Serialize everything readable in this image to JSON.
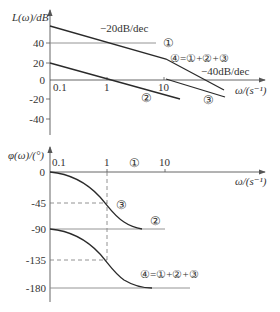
{
  "magnitude_plot": {
    "y_label": "L(ω)/dB",
    "x_label": "ω/(s⁻¹)",
    "y_ticks": [
      {
        "label": "40",
        "value": 40
      },
      {
        "label": "20",
        "value": 20
      },
      {
        "label": "0",
        "value": 0
      },
      {
        "label": "-20",
        "value": -20
      },
      {
        "label": "-40",
        "value": -40
      }
    ],
    "x_ticks": [
      {
        "label": "0.1",
        "value": 0.1
      },
      {
        "label": "1",
        "value": 1
      },
      {
        "label": "10",
        "value": 10
      }
    ],
    "slope_labels": {
      "minus20": "−20dB/dec",
      "minus40": "−40dB/dec"
    },
    "curve_labels": {
      "c1": "①",
      "c2": "②",
      "c3": "③",
      "c4": "④=①+②+③"
    }
  },
  "phase_plot": {
    "y_label": "φ(ω)/(°)",
    "x_label": "ω/(s⁻¹)",
    "y_ticks": [
      {
        "label": "0",
        "value": 0
      },
      {
        "label": "-45",
        "value": -45
      },
      {
        "label": "-90",
        "value": -90
      },
      {
        "label": "-135",
        "value": -135
      },
      {
        "label": "-180",
        "value": -180
      }
    ],
    "x_ticks": [
      {
        "label": "0.1",
        "value": 0.1
      },
      {
        "label": "1",
        "value": 1
      },
      {
        "label": "10",
        "value": 10
      }
    ],
    "curve_labels": {
      "c1": "①",
      "c2": "②",
      "c3": "③",
      "c4": "④=①+②+③"
    }
  },
  "colors": {
    "curve": "#2a2a2a",
    "axis": "#555555",
    "grid_line": "#888888",
    "dashed": "#777777",
    "text": "#333333"
  }
}
